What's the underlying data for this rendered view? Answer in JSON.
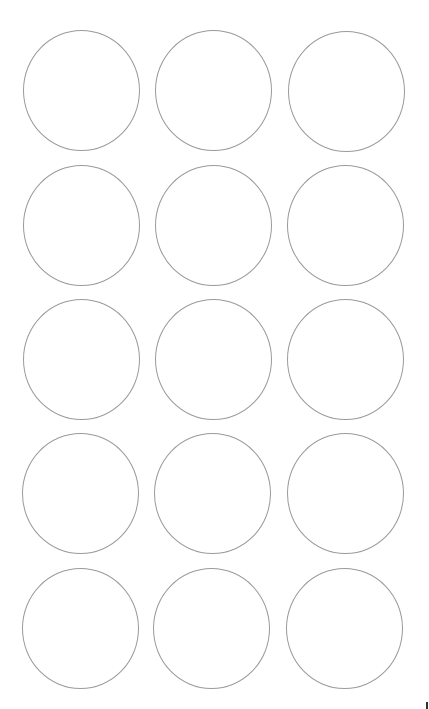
{
  "sheet": {
    "type": "circle-label-template",
    "rows": 5,
    "columns": 3,
    "label_count": 15,
    "outline_color": "#9a9a9a",
    "background_color": "#ffffff",
    "labels": [
      {
        "row": 1,
        "col": 1
      },
      {
        "row": 1,
        "col": 2
      },
      {
        "row": 1,
        "col": 3
      },
      {
        "row": 2,
        "col": 1
      },
      {
        "row": 2,
        "col": 2
      },
      {
        "row": 2,
        "col": 3
      },
      {
        "row": 3,
        "col": 1
      },
      {
        "row": 3,
        "col": 2
      },
      {
        "row": 3,
        "col": 3
      },
      {
        "row": 4,
        "col": 1
      },
      {
        "row": 4,
        "col": 2
      },
      {
        "row": 4,
        "col": 3
      },
      {
        "row": 5,
        "col": 1
      },
      {
        "row": 5,
        "col": 2
      },
      {
        "row": 5,
        "col": 3
      }
    ]
  }
}
